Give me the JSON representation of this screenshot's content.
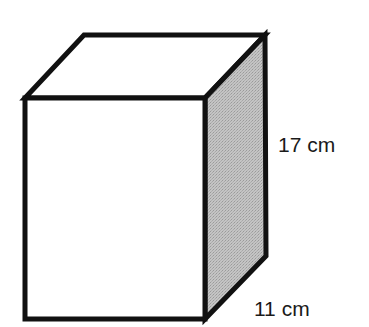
{
  "diagram": {
    "type": "rectangular-prism",
    "colors": {
      "stroke": "#111111",
      "front_face": "#ffffff",
      "top_face": "#ffffff",
      "side_face": "#bdbdbd"
    },
    "labels": {
      "height": "17 cm",
      "depth": "11 cm"
    }
  }
}
